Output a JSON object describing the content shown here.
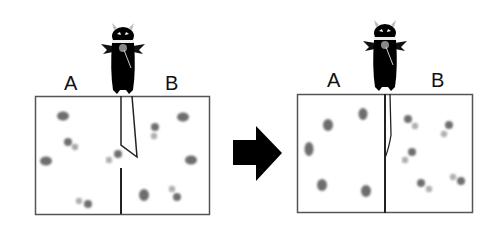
{
  "diagram": {
    "title": "",
    "arrow": {
      "direction": "right",
      "color": "#000000"
    },
    "panels": [
      {
        "id": "before",
        "labels": {
          "left": "A",
          "right": "B"
        },
        "gate": "open",
        "molecules_left": 5,
        "molecules_right": 5
      },
      {
        "id": "after",
        "labels": {
          "left": "A",
          "right": "B"
        },
        "gate": "closed",
        "molecules_left": 5,
        "molecules_right": 5
      }
    ],
    "colors": {
      "box_border": "#555555",
      "divider": "#222222",
      "molecule": "#6e6e6e",
      "demon": "#000000"
    }
  }
}
